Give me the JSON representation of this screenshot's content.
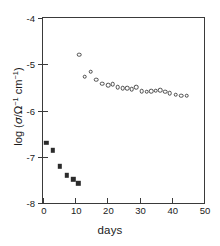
{
  "chart_data": {
    "type": "scatter",
    "title": "",
    "xlabel": "days",
    "ylabel": "log (σ/Ω⁻¹ cm⁻¹)",
    "ylabel_parts": {
      "prefix": "log (",
      "symbol": "σ",
      "slash": "/",
      "omega": "Ω",
      "omega_exp": "-1",
      "unit": "cm",
      "unit_exp": "-1",
      "suffix": ")"
    },
    "xlim": [
      0,
      50
    ],
    "ylim": [
      -8,
      -4
    ],
    "xticks": [
      0,
      10,
      20,
      30,
      40,
      50
    ],
    "yticks": [
      -4,
      -5,
      -6,
      -7,
      -8
    ],
    "xtick_labels": [
      "0",
      "10",
      "20",
      "30",
      "40",
      "50"
    ],
    "ytick_labels": [
      "-4",
      "-5",
      "-6",
      "-7",
      "-8"
    ],
    "grid": false,
    "legend": "none",
    "series": [
      {
        "name": "filled-squares",
        "marker": "filled-square",
        "color": "#2b2b2b",
        "x": [
          1.0,
          3.0,
          5.2,
          7.4,
          9.4,
          11.0
        ],
        "y": [
          -6.7,
          -6.86,
          -7.21,
          -7.4,
          -7.49,
          -7.57
        ]
      },
      {
        "name": "open-circles",
        "marker": "open-circle",
        "color": "#4a4a4a",
        "x": [
          11.2,
          13.0,
          14.8,
          16.6,
          18.4,
          20.2,
          21.6,
          23.2,
          24.8,
          26.2,
          27.6,
          29.0,
          30.6,
          32.2,
          33.6,
          35.0,
          36.4,
          38.0,
          39.4,
          41.2,
          43.0,
          44.6
        ],
        "y": [
          -4.79,
          -5.27,
          -5.16,
          -5.33,
          -5.42,
          -5.45,
          -5.43,
          -5.5,
          -5.52,
          -5.52,
          -5.54,
          -5.5,
          -5.58,
          -5.59,
          -5.58,
          -5.57,
          -5.56,
          -5.59,
          -5.62,
          -5.66,
          -5.68,
          -5.68
        ]
      }
    ]
  }
}
